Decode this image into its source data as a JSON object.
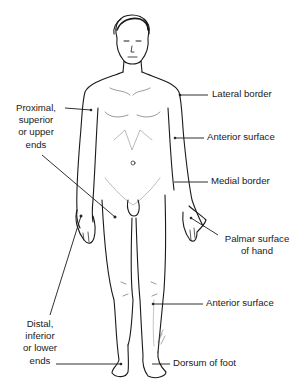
{
  "diagram": {
    "labels": {
      "lateral_border": "Lateral border",
      "anterior_surface_arm": "Anterior surface",
      "medial_border": "Medial border",
      "palmar_surface": [
        "Palmar surface",
        "of hand"
      ],
      "anterior_surface_leg": "Anterior surface",
      "dorsum_of_foot": "Dorsum of foot",
      "proximal": [
        "Proximal,",
        "superior",
        "or upper",
        "ends"
      ],
      "distal": [
        "Distal,",
        "inferior",
        "or lower",
        "ends"
      ]
    },
    "colors": {
      "line": "#1a1a1a",
      "background": "#ffffff"
    }
  }
}
